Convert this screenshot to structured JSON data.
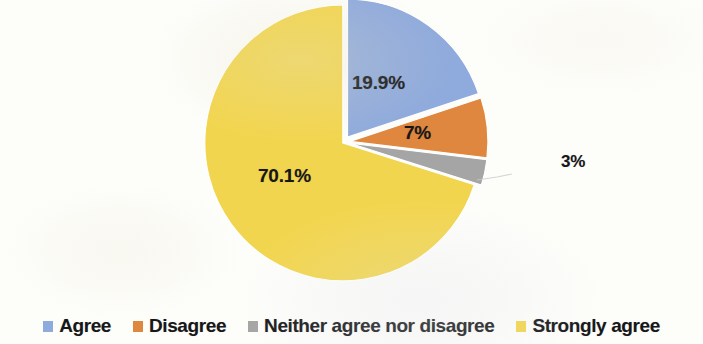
{
  "chart_data": {
    "type": "pie",
    "title": "",
    "subtitle": "",
    "xlabel": "",
    "ylabel": "",
    "grid": false,
    "legend_position": "bottom",
    "start_angle_deg": 0,
    "direction": "clockwise",
    "exploded": true,
    "categories": [
      "Agree",
      "Disagree",
      "Neither agree nor disagree",
      "Strongly agree"
    ],
    "values": [
      19.9,
      7,
      3,
      70.1
    ],
    "data_labels": [
      "19.9%",
      "7%",
      "3%",
      "70.1%"
    ],
    "colors": [
      "#8FAADC",
      "#E0873F",
      "#A5A5A5",
      "#F2D54E"
    ],
    "slices": [
      {
        "label": "Agree",
        "value": 19.9,
        "data_label": "19.9%",
        "color": "#8FAADC",
        "label_inside": true
      },
      {
        "label": "Disagree",
        "value": 7,
        "data_label": "7%",
        "color": "#E0873F",
        "label_inside": true
      },
      {
        "label": "Neither agree nor disagree",
        "value": 3,
        "data_label": "3%",
        "color": "#A5A5A5",
        "label_inside": false
      },
      {
        "label": "Strongly agree",
        "value": 70.1,
        "data_label": "70.1%",
        "color": "#F2D54E",
        "label_inside": true
      }
    ],
    "units": "percent",
    "total": 100
  },
  "legend": {
    "items": [
      {
        "label": "Agree",
        "color": "#8FAADC"
      },
      {
        "label": "Disagree",
        "color": "#E0873F"
      },
      {
        "label": "Neither agree nor disagree",
        "color": "#A5A5A5"
      },
      {
        "label": "Strongly agree",
        "color": "#F2D54E"
      }
    ]
  },
  "labels": {
    "agree": "19.9%",
    "disagree": "7%",
    "neither": "3%",
    "strongly_agree": "70.1%"
  }
}
